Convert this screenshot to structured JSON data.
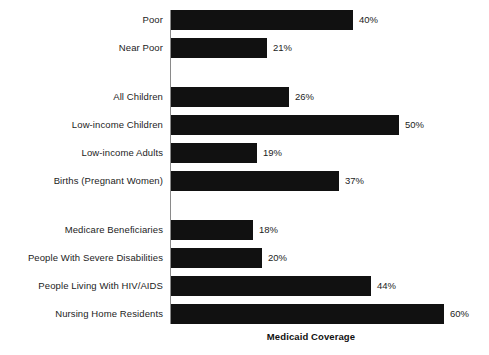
{
  "chart_data": {
    "type": "bar",
    "orientation": "horizontal",
    "title": "",
    "xlabel": "Medicaid Coverage",
    "ylabel": "",
    "xlim": [
      0,
      60
    ],
    "grid": false,
    "legend": null,
    "value_suffix": "%",
    "categories": [
      "Poor",
      "Near Poor",
      "All Children",
      "Low-income Children",
      "Low-income Adults",
      "Births (Pregnant Women)",
      "Medicare Beneficiaries",
      "People With Severe Disabilities",
      "People Living With HIV/AIDS",
      "Nursing Home Residents"
    ],
    "values": [
      40,
      21,
      26,
      50,
      19,
      37,
      18,
      20,
      44,
      60
    ],
    "value_labels": [
      "40%",
      "21%",
      "26%",
      "50%",
      "19%",
      "37%",
      "18%",
      "20%",
      "44%",
      "60%"
    ],
    "groups": [
      {
        "name": "income",
        "indices": [
          0,
          1
        ]
      },
      {
        "name": "population",
        "indices": [
          2,
          3,
          4,
          5
        ]
      },
      {
        "name": "special",
        "indices": [
          6,
          7,
          8,
          9
        ]
      }
    ],
    "bar_color": "#111111",
    "axis_color": "#8a8a8a"
  },
  "layout": {
    "bar_height": 20,
    "bar_gap": 8,
    "group_gap": 29,
    "axis_x": 170,
    "first_bar_y": 10,
    "px_per_unit": 4.55,
    "label_right_edge": 163,
    "value_offset": 6
  }
}
